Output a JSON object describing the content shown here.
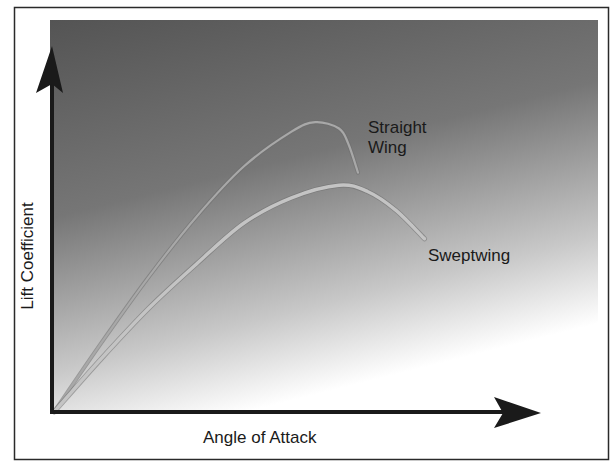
{
  "chart_data": {
    "type": "line",
    "title": "",
    "xlabel": "Angle of Attack",
    "ylabel": "Lift Coefficient",
    "grid": false,
    "legend": "inline labels",
    "x_ticks": [],
    "y_ticks": [],
    "xlim": [
      0,
      100
    ],
    "ylim": [
      0,
      100
    ],
    "series": [
      {
        "name": "Straight Wing",
        "label_lines": [
          "Straight",
          "Wing"
        ],
        "x": [
          0,
          10,
          20,
          30,
          40,
          50,
          55,
          60,
          62,
          64
        ],
        "y": [
          0,
          22,
          43,
          62,
          78,
          89,
          92,
          90,
          85,
          76
        ],
        "color": "#a8a8a8"
      },
      {
        "name": "Sweptwing",
        "label_lines": [
          "Sweptwing"
        ],
        "x": [
          0,
          10,
          20,
          30,
          40,
          50,
          60,
          66,
          72,
          78
        ],
        "y": [
          0,
          17,
          33,
          47,
          60,
          68,
          72,
          70,
          64,
          55
        ],
        "color": "#c4c4c4"
      }
    ],
    "background": {
      "gradient_top": "#545454",
      "gradient_bottom": "#ffffff"
    }
  }
}
